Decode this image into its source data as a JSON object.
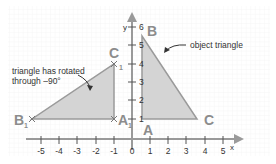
{
  "diagram": {
    "axes": {
      "x_label": "x",
      "y_label": "y",
      "x_ticks": [
        "-5",
        "-4",
        "-3",
        "-2",
        "-1",
        "0",
        "1",
        "2",
        "3",
        "4",
        "5"
      ],
      "y_ticks": [
        "1",
        "2",
        "3",
        "4",
        "5",
        "6"
      ]
    },
    "object_triangle": {
      "label": "object triangle",
      "vertices": {
        "A": "A",
        "B": "B",
        "C": "C"
      },
      "coords": {
        "A": [
          1,
          1
        ],
        "B": [
          1,
          5.5
        ],
        "C": [
          4,
          1
        ]
      }
    },
    "image_triangle": {
      "label_line1": "triangle has rotated",
      "label_line2": "through –90°",
      "vertices": {
        "A1": "A",
        "B1": "B",
        "C1": "C",
        "sub": "1"
      },
      "coords": {
        "A1": [
          -1,
          1
        ],
        "B1": [
          -5.5,
          1
        ],
        "C1": [
          -1,
          4
        ]
      }
    },
    "colors": {
      "axis": "#9a9a9a",
      "triangle_fill": "#d4d4d4",
      "triangle_stroke": "#9a9a9a",
      "vertex_label": "#8c8c8c",
      "grid": "#eeeeee",
      "text": "#333333"
    }
  }
}
